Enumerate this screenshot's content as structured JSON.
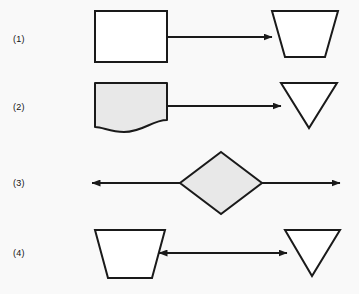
{
  "figure": {
    "kind": "flowchart-symbol-diagram",
    "width": 359,
    "height": 294,
    "background_color": "#f9f9f9",
    "stroke_color": "#1a1a1a",
    "fill_white": "#ffffff",
    "fill_gray": "#e8e8e8"
  },
  "rows": [
    {
      "label": "(1)",
      "left_shape": "rectangle",
      "left_fill": "#ffffff",
      "connector": "arrow-right",
      "right_shape": "trapezoid-wide-top",
      "right_fill": "#ffffff"
    },
    {
      "label": "(2)",
      "left_shape": "document-wavy-bottom",
      "left_fill": "#e8e8e8",
      "connector": "arrow-right",
      "right_shape": "triangle-down",
      "right_fill": "#ffffff"
    },
    {
      "label": "(3)",
      "left_shape": "none",
      "left_fill": "",
      "connector": "arrow-both-through-diamond",
      "right_shape": "none",
      "right_fill": "",
      "center_shape": "diamond",
      "center_fill": "#e8e8e8"
    },
    {
      "label": "(4)",
      "left_shape": "trapezoid-wide-top",
      "left_fill": "#ffffff",
      "connector": "arrow-both",
      "right_shape": "triangle-down",
      "right_fill": "#ffffff"
    }
  ]
}
